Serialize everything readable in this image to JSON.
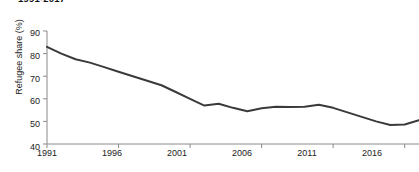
{
  "figure": {
    "title": "1991-2017",
    "background_color": "#ffffff"
  },
  "axes": {
    "ylabel": "Refugee share (%)",
    "xlabel": "",
    "y_ticks": [
      40,
      50,
      60,
      70,
      80,
      90
    ],
    "x_ticks": [
      1991,
      1996,
      2001,
      2006,
      2011,
      2016
    ],
    "line_color": "#3a3a3a",
    "axis_color": "#8a8a8a"
  },
  "chart_data": {
    "type": "line",
    "title": "1991-2017",
    "xlabel": "",
    "ylabel": "Refugee share (%)",
    "xlim": [
      1991,
      2017
    ],
    "ylim": [
      40,
      90
    ],
    "grid": false,
    "legend": "none",
    "x": [
      1991,
      1992,
      1993,
      1994,
      1995,
      1996,
      1997,
      1998,
      1999,
      2000,
      2001,
      2002,
      2003,
      2004,
      2005,
      2006,
      2007,
      2008,
      2009,
      2010,
      2011,
      2012,
      2013,
      2014,
      2015,
      2016,
      2017
    ],
    "series": [
      {
        "name": "Refugee share",
        "color": "#3a3a3a",
        "values": [
          83.0,
          80.0,
          77.5,
          76.0,
          74.0,
          72.0,
          70.0,
          68.0,
          66.0,
          63.0,
          60.0,
          57.0,
          57.8,
          56.0,
          54.5,
          55.8,
          56.5,
          56.4,
          56.5,
          57.4,
          56.0,
          54.0,
          52.0,
          50.0,
          48.4,
          48.6,
          50.5
        ]
      }
    ]
  }
}
